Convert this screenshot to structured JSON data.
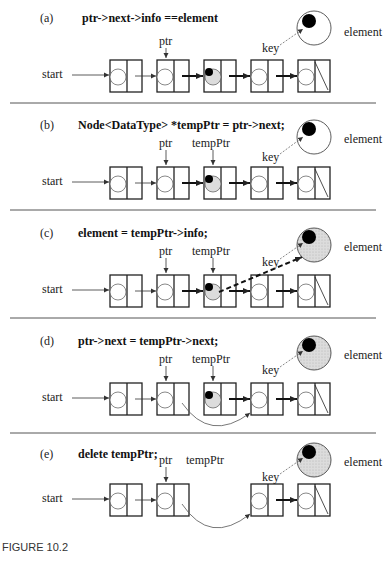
{
  "figure": {
    "caption": "FIGURE 10.2",
    "panels": [
      {
        "id": "a",
        "label": "(a)",
        "code": "ptr->next->info ==element",
        "pointers": {
          "ptr": "ptr"
        },
        "element_label": "element",
        "key_label": "key"
      },
      {
        "id": "b",
        "label": "(b)",
        "code": "Node<DataType> *tempPtr = ptr->next;",
        "pointers": {
          "ptr": "ptr",
          "tempPtr": "tempPtr"
        },
        "element_label": "element",
        "key_label": "key"
      },
      {
        "id": "c",
        "label": "(c)",
        "code": "element = tempPtr->info;",
        "pointers": {
          "ptr": "ptr",
          "tempPtr": "tempPtr"
        },
        "element_label": "element",
        "key_label": "key"
      },
      {
        "id": "d",
        "label": "(d)",
        "code": "ptr->next = tempPtr->next;",
        "pointers": {
          "ptr": "ptr",
          "tempPtr": "tempPtr"
        },
        "element_label": "element",
        "key_label": "key"
      },
      {
        "id": "e",
        "label": "(e)",
        "code": "delete tempPtr;",
        "pointers": {
          "ptr": "ptr",
          "tempPtr": "tempPtr"
        },
        "element_label": "element",
        "key_label": "key"
      }
    ],
    "start_label": "start",
    "colors": {
      "line": "#222222",
      "fill_gray": "#d9d9d9",
      "key_dot": "#000000",
      "divider": "#555555"
    }
  }
}
